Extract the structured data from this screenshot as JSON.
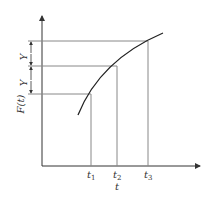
{
  "diagram": {
    "title": "",
    "y_axis_label": "F(t)",
    "x_axis_label": "t",
    "interval_labels": [
      "Y",
      "Y"
    ],
    "x_ticks": [
      {
        "base": "t",
        "sub": "1"
      },
      {
        "base": "t",
        "sub": "2"
      },
      {
        "base": "t",
        "sub": "3"
      }
    ],
    "colors": {
      "axis": "#333333",
      "guide": "#888888",
      "curve": "#222222"
    }
  }
}
